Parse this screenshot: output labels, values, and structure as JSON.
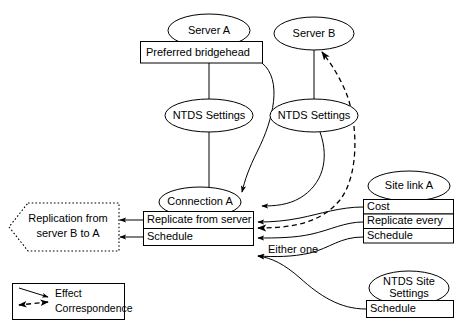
{
  "diagram": {
    "nodes": {
      "server_a": {
        "label": "Server A",
        "shape": "ellipse"
      },
      "server_b": {
        "label": "Server B",
        "shape": "ellipse"
      },
      "preferred_bridgehead": {
        "label": "Preferred bridgehead",
        "shape": "box"
      },
      "ntds_settings_a": {
        "label": "NTDS Settings",
        "shape": "ellipse"
      },
      "ntds_settings_b": {
        "label": "NTDS Settings",
        "shape": "ellipse"
      },
      "connection_a": {
        "label": "Connection A",
        "shape": "ellipse"
      },
      "connection_a_rows": [
        {
          "label": "Replicate from server"
        },
        {
          "label": "Schedule"
        }
      ],
      "site_link_a": {
        "label": "Site link A",
        "shape": "ellipse"
      },
      "site_link_a_rows": [
        {
          "label": "Cost"
        },
        {
          "label": "Replicate every"
        },
        {
          "label": "Schedule"
        }
      ],
      "ntds_site_settings": {
        "label_line1": "NTDS Site",
        "label_line2": "Settings",
        "shape": "ellipse"
      },
      "ntds_site_settings_rows": [
        {
          "label": "Schedule"
        }
      ],
      "replication_result": {
        "label_line1": "Replication from",
        "label_line2": "server B to A",
        "shape": "dotted-hexagon"
      }
    },
    "annotations": [
      {
        "name": "either-one",
        "label": "Either one"
      }
    ],
    "legend": {
      "items": [
        {
          "label": "Effect",
          "line_style": "solid"
        },
        {
          "label": "Correspondence",
          "line_style": "dashed"
        }
      ]
    },
    "colors": {
      "stroke": "#000000",
      "fill": "#ffffff",
      "text": "#000000"
    }
  }
}
